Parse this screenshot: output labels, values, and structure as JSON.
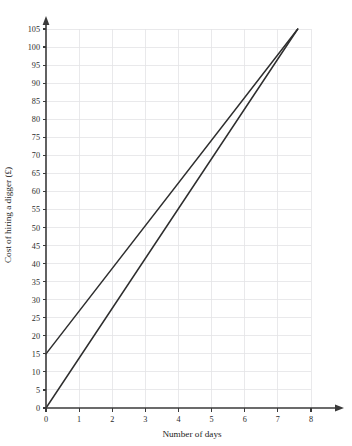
{
  "chart_data": {
    "type": "line",
    "title": "",
    "xlabel": "Number of days",
    "ylabel": "Cost of hiring a digger (£)",
    "xlim": [
      0,
      8
    ],
    "ylim": [
      0,
      105
    ],
    "grid": true,
    "legend": "none",
    "x_ticks": [
      0,
      1,
      2,
      3,
      4,
      5,
      6,
      7,
      8
    ],
    "x_tick_labels": [
      "0",
      "1",
      "2",
      "3",
      "4",
      "5",
      "6",
      "7",
      "8"
    ],
    "y_ticks": [
      0,
      5,
      10,
      15,
      20,
      25,
      30,
      35,
      40,
      45,
      50,
      55,
      60,
      65,
      70,
      75,
      80,
      85,
      90,
      95,
      100,
      105
    ],
    "y_tick_labels": [
      "0",
      "5",
      "10",
      "15",
      "20",
      "25",
      "30",
      "35",
      "40",
      "45",
      "50",
      "55",
      "60",
      "65",
      "70",
      "75",
      "80",
      "85",
      "90",
      "95",
      "100",
      "105"
    ],
    "series": [
      {
        "name": "line-upper",
        "points": [
          [
            0,
            15
          ],
          [
            7.6,
            105
          ]
        ],
        "intercept": 15,
        "slope": 11.84,
        "color": "#2e2e2e"
      },
      {
        "name": "line-lower",
        "points": [
          [
            0,
            0
          ],
          [
            7.6,
            105
          ]
        ],
        "intercept": 0,
        "slope": 13.82,
        "color": "#2e2e2e"
      }
    ]
  },
  "axes": {
    "x_arrow": "arrow-right",
    "y_arrow": "arrow-up"
  },
  "colors": {
    "grid": "#e3e3e6",
    "axis": "#3a3a3a",
    "line": "#2e2e2e",
    "background": "#ffffff"
  }
}
